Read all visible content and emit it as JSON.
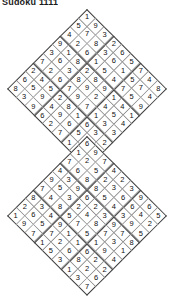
{
  "page": {
    "title": "Sudoku 1111",
    "background_color": "#ffffff",
    "text_color": "#111111",
    "grid_line_color": "#8a8a8a",
    "box_line_color": "#3a3a3a",
    "width": 174,
    "height": 273
  },
  "puzzles": [
    {
      "name": "upper-sudoku-diamond",
      "rotation_degrees": 45,
      "size": 9,
      "cell_size": 12.6,
      "origin_x": 87,
      "origin_y": 9,
      "rows": [
        [
          1,
          9,
          3,
          2,
          6,
          5,
          7,
          4,
          8
        ],
        [
          5,
          7,
          8,
          3,
          6,
          1,
          5,
          7,
          4
        ],
        [
          4,
          2,
          6,
          1,
          5,
          4,
          7,
          5,
          9
        ],
        [
          9,
          1,
          8,
          2,
          8,
          9,
          1,
          4,
          1
        ],
        [
          3,
          6,
          3,
          8,
          9,
          2,
          4,
          5,
          4
        ],
        [
          7,
          2,
          6,
          7,
          9,
          7,
          1,
          3,
          3
        ],
        [
          2,
          4,
          5,
          2,
          8,
          1,
          6,
          3,
          2
        ],
        [
          6,
          5,
          9,
          4,
          9,
          6,
          5,
          8,
          5
        ],
        [
          8,
          3,
          9,
          6,
          2,
          7,
          1,
          6,
          8
        ]
      ]
    },
    {
      "name": "lower-sudoku-diamond",
      "rotation_degrees": 45,
      "size": 9,
      "cell_size": 12.6,
      "origin_x": 87,
      "origin_y": 136,
      "rows": [
        [
          6,
          9,
          7,
          4,
          2,
          3,
          9,
          6,
          5
        ],
        [
          1,
          2,
          5,
          2,
          3,
          6,
          6,
          4,
          2
        ],
        [
          7,
          6,
          8,
          8,
          5,
          4,
          3,
          9,
          5
        ],
        [
          4,
          3,
          9,
          6,
          2,
          3,
          9,
          7,
          8
        ],
        [
          9,
          5,
          3,
          2,
          4,
          8,
          7,
          3,
          1
        ],
        [
          7,
          4,
          8,
          5,
          7,
          5,
          1,
          9,
          4
        ],
        [
          8,
          3,
          4,
          9,
          1,
          1,
          6,
          2,
          2
        ],
        [
          2,
          6,
          5,
          7,
          2,
          6,
          8,
          2,
          6
        ],
        [
          1,
          9,
          7,
          1,
          5,
          3,
          1,
          3,
          7
        ]
      ]
    }
  ]
}
